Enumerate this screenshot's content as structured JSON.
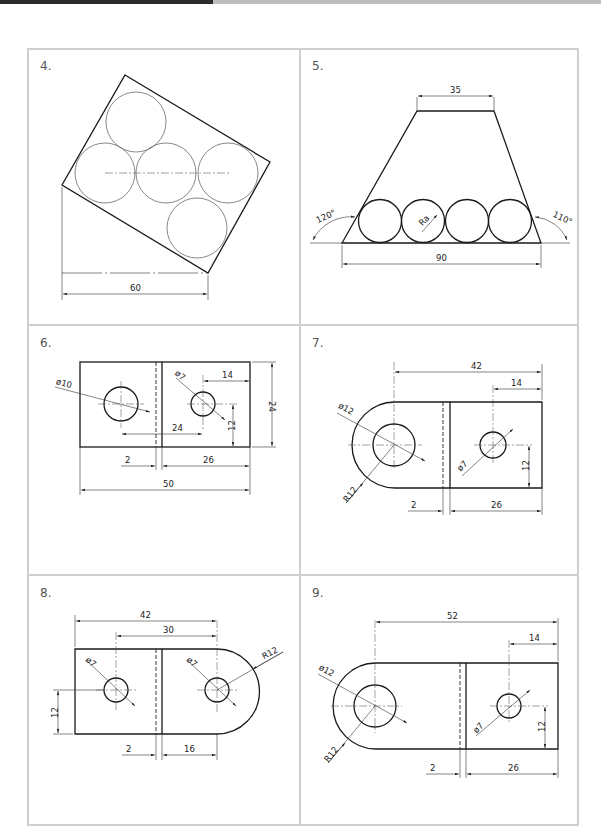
{
  "panels": [
    {
      "id": "4",
      "label": "4.",
      "dims": {
        "width": "60"
      }
    },
    {
      "id": "5",
      "label": "5.",
      "dims": {
        "top": "35",
        "bottom": "90",
        "left_angle": "120°",
        "right_angle": "110°",
        "radius": "Ra"
      }
    },
    {
      "id": "6",
      "label": "6.",
      "dims": {
        "d_left": "ø10",
        "d_right": "ø7",
        "h14": "14",
        "h24_inner": "24",
        "v12": "12",
        "v24": "24",
        "w2": "2",
        "w26": "26",
        "w50": "50"
      }
    },
    {
      "id": "7",
      "label": "7.",
      "dims": {
        "w42": "42",
        "w14": "14",
        "d12": "ø12",
        "d7": "ø7",
        "r12": "R12",
        "v12": "12",
        "w2": "2",
        "w26": "26"
      }
    },
    {
      "id": "8",
      "label": "8.",
      "dims": {
        "w42": "42",
        "w30": "30",
        "d7a": "ø7",
        "d7b": "ø7",
        "r12": "R12",
        "v12": "12",
        "w2": "2",
        "w16": "16"
      }
    },
    {
      "id": "9",
      "label": "9.",
      "dims": {
        "w52": "52",
        "w14": "14",
        "d12": "ø12",
        "d7": "ø7",
        "r12": "R12",
        "v12": "12",
        "w2": "2",
        "w26": "26"
      }
    }
  ],
  "colors": {
    "frame": "#cfcfcf",
    "line": "#1a1a1a",
    "topbar_dark": "#2b2b2b",
    "topbar_light": "#bdbdbd"
  }
}
